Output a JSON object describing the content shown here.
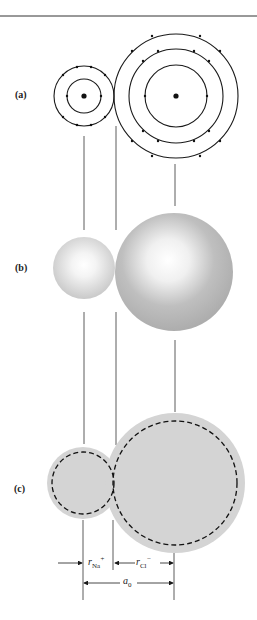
{
  "panels": [
    {
      "id": "a",
      "label": "(a)",
      "description": "Bohr shell model of Na+ and Cl- ions"
    },
    {
      "id": "b",
      "label": "(b)",
      "description": "Shaded sphere electron-cloud model"
    },
    {
      "id": "c",
      "label": "(c)",
      "description": "Hard-sphere model with dashed ionic radii, spheres touching"
    }
  ],
  "ions": {
    "cation": {
      "name": "Na+",
      "shells": 2,
      "electrons_per_shell": [
        2,
        8
      ]
    },
    "anion": {
      "name": "Cl-",
      "shells": 3,
      "electrons_per_shell": [
        2,
        8,
        8
      ]
    }
  },
  "dimensions": {
    "r_cation": {
      "symbol": "r",
      "subscript": "Na",
      "superscript": "+"
    },
    "r_anion": {
      "symbol": "r",
      "subscript": "Cl",
      "superscript": "−"
    },
    "lattice": {
      "symbol": "a",
      "subscript": "0"
    }
  },
  "colors": {
    "line": "#1a1a1a",
    "sphere_fill": "#bdbdbd",
    "sphere_highlight": "#ffffff",
    "hard_sphere_fill": "#d4d4d4"
  }
}
